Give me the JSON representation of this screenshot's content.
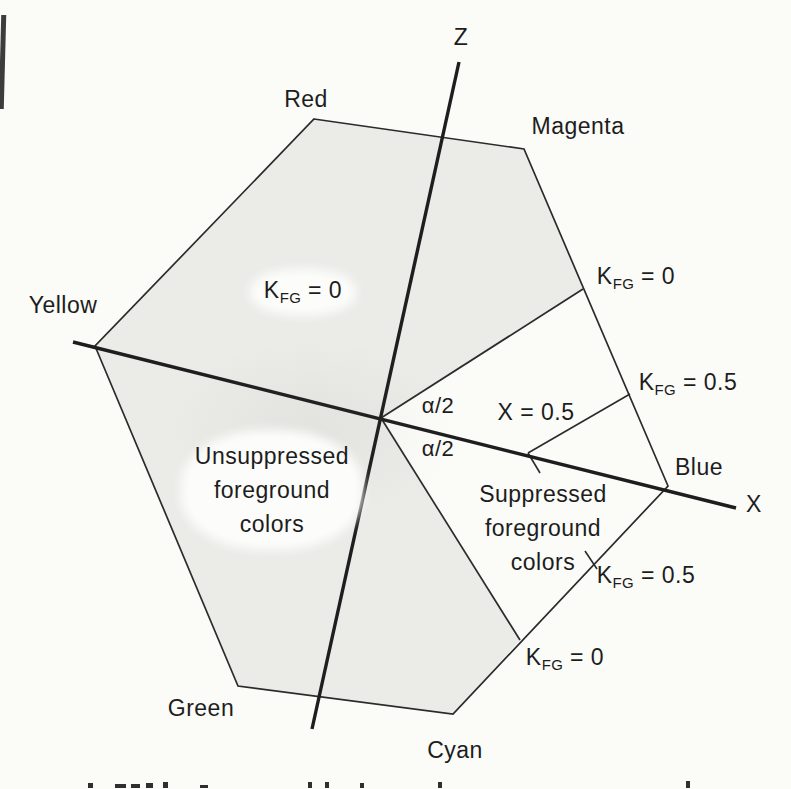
{
  "figure": {
    "axis_labels": {
      "z": "Z",
      "x": "X"
    },
    "vertex_labels": {
      "red": "Red",
      "magenta": "Magenta",
      "yellow": "Yellow",
      "blue": "Blue",
      "green": "Green",
      "cyan": "Cyan"
    },
    "region_labels": {
      "kfg_zero": {
        "base": "K",
        "sub": "FG",
        "eq": " = 0"
      },
      "unsuppressed": "Unsuppressed\nforeground\ncolors",
      "suppressed": "Suppressed\nforeground\ncolors"
    },
    "edge_annotations": {
      "kfg0_upper": {
        "base": "K",
        "sub": "FG",
        "eq": " = 0"
      },
      "kfg05_upper": {
        "base": "K",
        "sub": "FG",
        "eq": " = 0.5"
      },
      "kfg05_lower": {
        "base": "K",
        "sub": "FG",
        "eq": " = 0.5"
      },
      "kfg0_lower": {
        "base": "K",
        "sub": "FG",
        "eq": " = 0"
      }
    },
    "axis_annotations": {
      "x_half": "X = 0.5",
      "alpha_upper": "α/2",
      "alpha_lower": "α/2"
    },
    "colors": {
      "hexagon_fill": "#ebebe8",
      "line": "#242424",
      "text": "#1d1d1d",
      "page_background": "#fbfbf8"
    }
  }
}
